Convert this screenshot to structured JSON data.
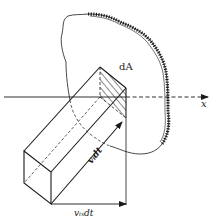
{
  "diagram": {
    "title": "",
    "labels": {
      "area_element": "dA",
      "axis": "x",
      "velocity_displacement": "vᵢdt",
      "x_component_displacement": "vᵢₓdt"
    },
    "elements": [
      {
        "type": "irregular-surface",
        "description": "control surface with hatched boundary on right side"
      },
      {
        "type": "oblique-prism",
        "description": "fluid column crossing area element dA during time dt"
      },
      {
        "type": "axis",
        "name": "x",
        "direction": "right"
      },
      {
        "type": "vector",
        "label": "vᵢdt",
        "along": "prism edge"
      },
      {
        "type": "vector",
        "label": "vᵢₓdt",
        "along": "x direction"
      }
    ],
    "colors": {
      "stroke": "#1a1a1a",
      "background": "#ffffff"
    }
  }
}
